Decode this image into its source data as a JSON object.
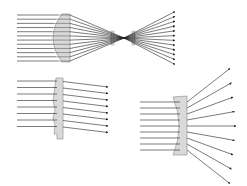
{
  "diagram": {
    "title": "",
    "colors": {
      "background": "#ffffff",
      "ray": "#222222",
      "lens_fill": "#d9d9d9",
      "lens_stroke": "#888888"
    },
    "panels": [
      {
        "id": "plano-convex-focusing",
        "lens_type": "plano-convex lens",
        "ray_count": 12,
        "behavior": "parallel rays converge to a focal point then diverge"
      },
      {
        "id": "fresnel",
        "lens_type": "Fresnel lens",
        "ray_count": 8,
        "behavior": "parallel rays deflected downward"
      },
      {
        "id": "plano-concave-diverging",
        "lens_type": "plano-concave lens",
        "ray_count": 9,
        "behavior": "parallel rays diverge"
      }
    ]
  }
}
